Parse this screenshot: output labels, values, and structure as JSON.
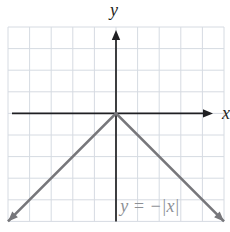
{
  "colors": {
    "background": "#ffffff",
    "grid": "#d6dbe2",
    "axis": "#1f1f22",
    "curve": "#77777b",
    "equation": "#8d9095"
  },
  "chart_data": {
    "type": "line",
    "xlabel": "x",
    "ylabel": "y",
    "xlim": [
      -5,
      5
    ],
    "ylim": [
      -5,
      4
    ],
    "grid": true,
    "grid_step": 1,
    "legend": false,
    "tick_labels": [],
    "series": [
      {
        "name": "y = −|x|",
        "points": [
          [
            -5,
            -5
          ],
          [
            0,
            0
          ],
          [
            5,
            -5
          ]
        ],
        "arrows": "both"
      }
    ],
    "annotations": [
      {
        "text": "y = −|x|",
        "x": 0.2,
        "y": -4.55
      }
    ]
  }
}
